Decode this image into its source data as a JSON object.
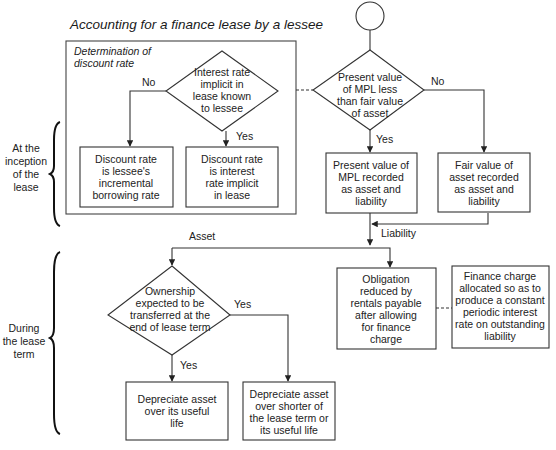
{
  "title": "Accounting for a finance lease by a lessee",
  "group_box": {
    "label_lines": [
      "Determination of",
      "discount rate"
    ]
  },
  "phases": {
    "inception": [
      "At the",
      "inception",
      "of the",
      "lease"
    ],
    "during": [
      "During",
      "the lease",
      "term"
    ]
  },
  "nodes": {
    "start": {
      "type": "terminator"
    },
    "pv_vs_fair": {
      "type": "decision",
      "lines": [
        "Present value",
        "of MPL less",
        "than fair value",
        "of asset"
      ]
    },
    "rate_known": {
      "type": "decision",
      "lines": [
        "Interest rate",
        "implicit in",
        "lease known",
        "to lessee"
      ]
    },
    "incremental": {
      "type": "process",
      "lines": [
        "Discount rate",
        "is lessee's",
        "incremental",
        "borrowing rate"
      ]
    },
    "implicit": {
      "type": "process",
      "lines": [
        "Discount rate",
        "is interest",
        "rate implicit",
        "in lease"
      ]
    },
    "pv_recorded": {
      "type": "process",
      "lines": [
        "Present value of",
        "MPL recorded",
        "as asset and",
        "liability"
      ]
    },
    "fair_recorded": {
      "type": "process",
      "lines": [
        "Fair value of",
        "asset recorded",
        "as asset and",
        "liability"
      ]
    },
    "ownership": {
      "type": "decision",
      "lines": [
        "Ownership",
        "expected to be",
        "transferred at the",
        "end of lease term"
      ]
    },
    "dep_useful": {
      "type": "process",
      "lines": [
        "Depreciate asset",
        "over its useful",
        "life"
      ]
    },
    "dep_shorter": {
      "type": "process",
      "lines": [
        "Depreciate asset",
        "over shorter of",
        "the lease term or",
        "its useful life"
      ]
    },
    "obligation": {
      "type": "process",
      "lines": [
        "Obligation",
        "reduced by",
        "rentals payable",
        "after allowing",
        "for finance",
        "charge"
      ]
    },
    "finance_charge": {
      "type": "process",
      "lines": [
        "Finance charge",
        "allocated so as to",
        "produce a constant",
        "periodic interest",
        "rate on outstanding",
        "liability"
      ]
    }
  },
  "edge_labels": {
    "rate_no": "No",
    "rate_yes": "Yes",
    "pv_no": "No",
    "pv_yes": "Yes",
    "liability": "Liability",
    "asset": "Asset",
    "own_yes_down": "Yes",
    "own_yes_right": "Yes"
  }
}
